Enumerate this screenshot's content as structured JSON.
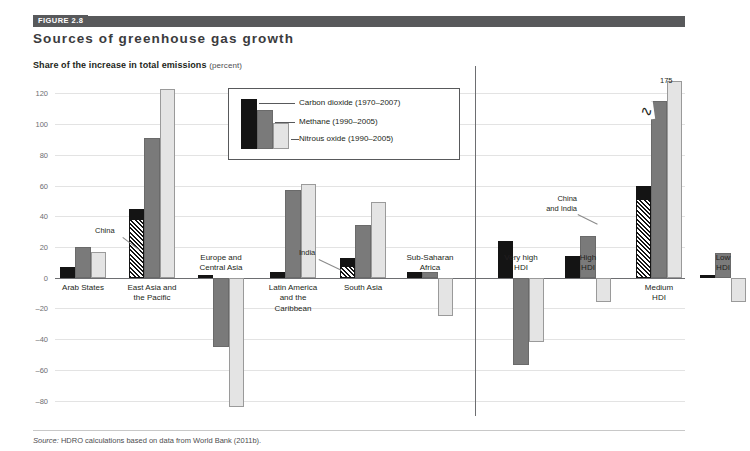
{
  "header": {
    "figure_tag": "FIGURE 2.8",
    "title": "Sources of greenhouse gas growth",
    "subtitle": "Share of the increase in total emissions",
    "subtitle_unit": "(percent)"
  },
  "legend": {
    "items": [
      {
        "label": "Carbon dioxide (1970–2007)",
        "color": "#141414"
      },
      {
        "label": "Methane (1990–2005)",
        "color": "#7a7a7a"
      },
      {
        "label": "Nitrous oxide (1990–2005)",
        "color": "#e4e4e4"
      }
    ]
  },
  "annotations": {
    "china": "China",
    "india": "India",
    "china_and_india": "China\nand India",
    "peak_value": "175"
  },
  "source": {
    "prefix": "Source:",
    "text": "HDRO calculations based on data from World Bank (2011b)."
  },
  "chart_data": {
    "type": "bar",
    "title": "Sources of greenhouse gas growth",
    "subtitle": "Share of the increase in total emissions (percent)",
    "xlabel": "",
    "ylabel": "Share of the increase in total emissions (percent)",
    "ylim": [
      -90,
      130
    ],
    "yticks": [
      120,
      100,
      80,
      60,
      40,
      20,
      0,
      -20,
      -40,
      -60,
      -80
    ],
    "ytick_labels": [
      "120",
      "100",
      "80",
      "60",
      "40",
      "20",
      "0",
      "–20",
      "–40",
      "–60",
      "–80"
    ],
    "grid": true,
    "legend_position": "inside-top-center",
    "groups": [
      "regions",
      "hdi"
    ],
    "categories": [
      "Arab States",
      "East Asia and\nthe Pacific",
      "Europe and\nCentral Asia",
      "Latin America\nand the\nCaribbean",
      "South Asia",
      "Sub-Saharan\nAfrica",
      "Very high\nHDI",
      "High\nHDI",
      "Medium\nHDI",
      "Low\nHDI"
    ],
    "series": [
      {
        "name": "Carbon dioxide (1970–2007)",
        "color": "#141414",
        "values": [
          7,
          45,
          2,
          4,
          13,
          4,
          24,
          14,
          60,
          2
        ]
      },
      {
        "name": "Methane (1990–2005)",
        "color": "#7a7a7a",
        "values": [
          20,
          91,
          -45,
          57,
          34,
          4,
          -57,
          27,
          115,
          16
        ]
      },
      {
        "name": "Nitrous oxide (1990–2005)",
        "color": "#e4e4e4",
        "values": [
          17,
          123,
          -84,
          61,
          49,
          -25,
          -42,
          -16,
          175,
          -16
        ]
      }
    ],
    "annotations": [
      {
        "text": "China",
        "target_category": "East Asia and\nthe Pacific",
        "target_series": "Carbon dioxide (1970–2007)"
      },
      {
        "text": "India",
        "target_category": "South Asia",
        "target_series": "Carbon dioxide (1970–2007)"
      },
      {
        "text": "China\nand India",
        "target_category": "Medium\nHDI",
        "target_series": "Carbon dioxide (1970–2007)"
      },
      {
        "text": "175",
        "target_category": "Medium\nHDI",
        "target_series": "Nitrous oxide (1990–2005)",
        "note": "bar truncated with axis break"
      }
    ]
  }
}
